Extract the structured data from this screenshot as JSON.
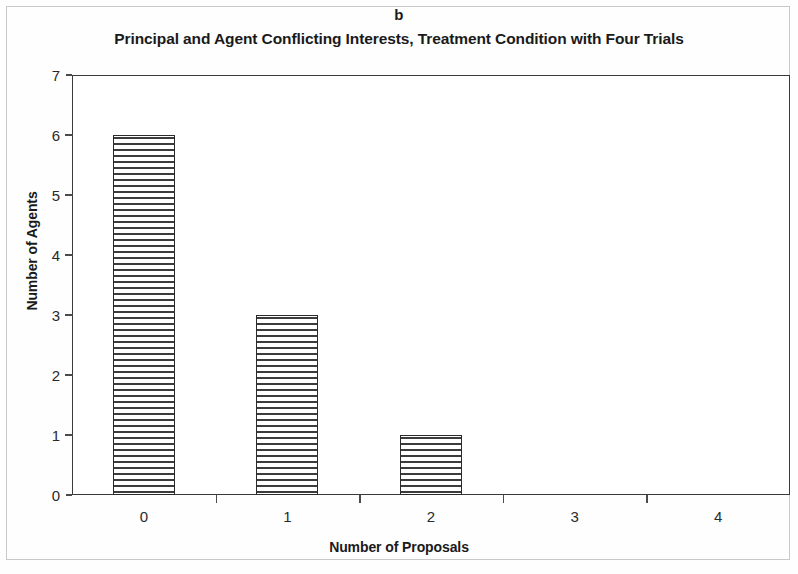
{
  "figure": {
    "panel_label": "b"
  },
  "chart_data": {
    "type": "bar",
    "title": "Principal and Agent Conflicting Interests, Treatment Condition with Four Trials",
    "xlabel": "Number of Proposals",
    "ylabel": "Number of Agents",
    "categories": [
      "0",
      "1",
      "2",
      "3",
      "4"
    ],
    "values": [
      6,
      3,
      1,
      0,
      0
    ],
    "ylim": [
      0,
      7
    ],
    "ytick_labels": [
      "0",
      "1",
      "2",
      "3",
      "4",
      "5",
      "6",
      "7"
    ],
    "ytick_values": [
      0,
      1,
      2,
      3,
      4,
      5,
      6,
      7
    ],
    "grid": false,
    "legend": false,
    "bar_fill": "horizontal-stripe-hatch",
    "colors": {
      "axis": "#3a3a3a",
      "bar_outline": "#2b2b2b",
      "bar_hatch": "#3c3c3c",
      "plot_background": "#ffffff",
      "text": "#1a1a1a",
      "frame": "#c9c9c9"
    }
  }
}
